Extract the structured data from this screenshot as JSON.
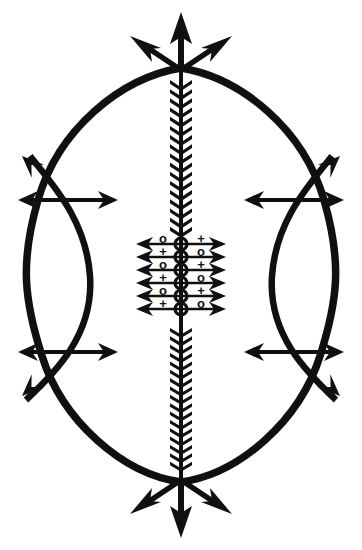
{
  "artwork": {
    "title": "Veve Ritual Symbol",
    "type": "ritual-line-drawing",
    "background_color": "#ffffff",
    "ink_color": "#101010",
    "canvas": {
      "width": 362,
      "height": 550
    }
  },
  "geometry": {
    "center_x": 181,
    "top_node_y": 68,
    "bottom_node_y": 482,
    "left_node_x": 68,
    "right_node_x": 294,
    "upper_node_y": 200,
    "lower_node_y": 352,
    "ellipse_bulge_x": 52,
    "lens_inner_offset": 22,
    "spine_half_width": 11
  },
  "spine": {
    "name": "central-feathered-shaft",
    "chevron_count_upper": 17,
    "chevron_count_lower": 17,
    "chevron_pitch": 10,
    "upper_span": [
      80,
      236
    ],
    "lower_span": [
      328,
      470
    ]
  },
  "top_finial": {
    "name": "top-trident",
    "center_arrow_tip_y": 14,
    "left_arrow_tip": [
      133,
      50
    ],
    "right_arrow_tip": [
      229,
      50
    ],
    "arrow_count": 3
  },
  "bottom_finial": {
    "name": "bottom-trident",
    "center_arrow_tip_y": 536,
    "left_arrow_tip": [
      133,
      500
    ],
    "right_arrow_tip": [
      229,
      500
    ],
    "arrow_count": 3
  },
  "side_nodes": [
    {
      "name": "upper-left-node",
      "x": 68,
      "y": 200,
      "h_arrow_span": [
        18,
        118
      ],
      "diag_tip": [
        22,
        156
      ],
      "diag_dir": "up-left"
    },
    {
      "name": "upper-right-node",
      "x": 294,
      "y": 200,
      "h_arrow_span": [
        244,
        344
      ],
      "diag_tip": [
        340,
        156
      ],
      "diag_dir": "up-right"
    },
    {
      "name": "lower-left-node",
      "x": 68,
      "y": 352,
      "h_arrow_span": [
        18,
        118
      ],
      "diag_tip": [
        22,
        396
      ],
      "diag_dir": "down-left"
    },
    {
      "name": "lower-right-node",
      "x": 294,
      "y": 352,
      "h_arrow_span": [
        244,
        344
      ],
      "diag_tip": [
        340,
        396
      ],
      "diag_dir": "down-right"
    }
  ],
  "center_grid": {
    "name": "central-symbol-matrix",
    "top": 238,
    "row_pitch": 13,
    "arrow_row_count": 6,
    "arrow_left_tip": 136,
    "arrow_right_tip": 226,
    "bead_count": 6,
    "bead_radius": 6,
    "left_column_x": 163,
    "right_column_x": 201,
    "left_symbols": [
      "o",
      "+",
      "o",
      "+",
      "o",
      "+"
    ],
    "right_symbols": [
      "+",
      "o",
      "+",
      "o",
      "+",
      "o"
    ],
    "symbol_rows": 6,
    "glyph_circle": "o",
    "glyph_cross": "+"
  },
  "outer_frame": {
    "name": "vesica-outer-curves",
    "description": "two mirrored arcs joining top and bottom nodes"
  }
}
